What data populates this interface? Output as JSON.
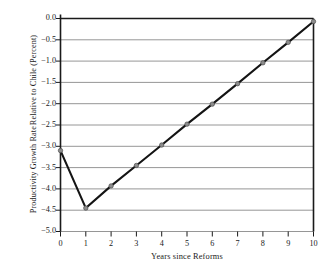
{
  "chart_data": {
    "type": "line",
    "title": "",
    "xlabel": "Years since Reforms",
    "ylabel": "Productivity Growth Rate Relative to Chile (Percent)",
    "ylabel_lines": [
      "Productivity Growth Rate",
      "Relative to Chile (Percent)"
    ],
    "x": [
      0,
      1,
      2,
      3,
      4,
      5,
      6,
      7,
      8,
      9,
      10
    ],
    "values": [
      -3.1,
      -4.45,
      -3.93,
      -3.45,
      -2.97,
      -2.48,
      -2.01,
      -1.53,
      -1.04,
      -0.56,
      -0.07
    ],
    "categories": [
      "0",
      "1",
      "2",
      "3",
      "4",
      "5",
      "6",
      "7",
      "8",
      "9",
      "10"
    ],
    "xticklabels": [
      "0",
      "1",
      "2",
      "3",
      "4",
      "5",
      "6",
      "7",
      "8",
      "9",
      "10"
    ],
    "yticklabels": [
      "0.0",
      "−0.5",
      "−1.0",
      "−1.5",
      "−2.0",
      "−2.5",
      "−3.0",
      "−3.5",
      "−4.0",
      "−4.5",
      "−5.0"
    ],
    "ytickvalues": [
      0.0,
      -0.5,
      -1.0,
      -1.5,
      -2.0,
      -2.5,
      -3.0,
      -3.5,
      -4.0,
      -4.5,
      -5.0
    ],
    "xlim": [
      0,
      10
    ],
    "ylim": [
      -5.0,
      0.0
    ],
    "grid": true,
    "grid_axis": "y",
    "legend": false,
    "legend_position": "none",
    "series": [
      {
        "name": "Productivity Growth Rate Relative to Chile",
        "values": [
          -3.1,
          -4.45,
          -3.93,
          -3.45,
          -2.97,
          -2.48,
          -2.01,
          -1.53,
          -1.04,
          -0.56,
          -0.07
        ]
      }
    ],
    "colors": {
      "line": "#141414",
      "marker_fill": "#8d8d8d",
      "marker_edge": "#4a4a4a",
      "grid": "#8a8a8a",
      "axis": "#1a1a1a",
      "background": "#ffffff",
      "text": "#1a1a1a"
    }
  }
}
